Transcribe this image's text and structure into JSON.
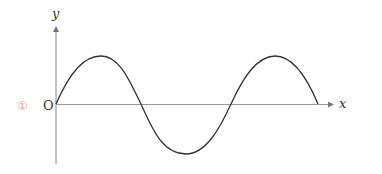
{
  "figure": {
    "marker": "①",
    "marker_color": "#e8a08e",
    "origin_label": "O",
    "x_axis_label": "x",
    "y_axis_label": "y",
    "axis_color": "#888888",
    "curve_color": "#333333",
    "curve": "sine wave starting at origin, 1.5 periods... ending at x-axis after two crests and one trough"
  }
}
